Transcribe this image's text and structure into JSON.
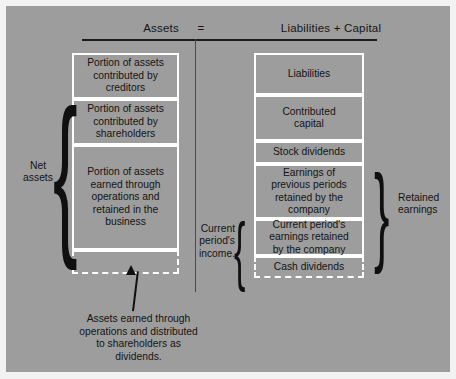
{
  "diagram": {
    "title_row": {
      "left_term": "Assets",
      "operator": "=",
      "right_term": "Liabilities + Capital"
    },
    "left_column": {
      "boxes": [
        {
          "label": "Portion of assets\ncontributed by\ncreditors",
          "style": "solid"
        },
        {
          "label": "Portion of assets\ncontributed by\nshareholders",
          "style": "solid"
        },
        {
          "label": "Portion of assets\nearned through\noperations and\nretained in the\nbusiness",
          "style": "solid"
        },
        {
          "label": "",
          "style": "dashed"
        }
      ],
      "brace_label": "Net\nassets"
    },
    "right_column": {
      "boxes": [
        {
          "label": "Liabilities",
          "style": "solid"
        },
        {
          "label": "Contributed\ncapital",
          "style": "solid"
        },
        {
          "label": "Stock dividends",
          "style": "solid"
        },
        {
          "label": "Earnings of\nprevious periods\nretained by the\ncompany",
          "style": "solid"
        },
        {
          "label": "Current period's\nearnings retained\nby the company",
          "style": "solid"
        },
        {
          "label": "Cash dividends",
          "style": "dashed"
        }
      ],
      "brace_label": "Retained\nearnings",
      "inner_brace_label": "Current\nperiod's\nincome."
    },
    "callout": {
      "text": "Assets earned through\noperations and distributed\nto shareholders as\ndividends."
    },
    "colors": {
      "background": "#9d9d9d",
      "box_border": "#ffffff",
      "text": "#141414",
      "rule": "#1b1b1b"
    }
  }
}
